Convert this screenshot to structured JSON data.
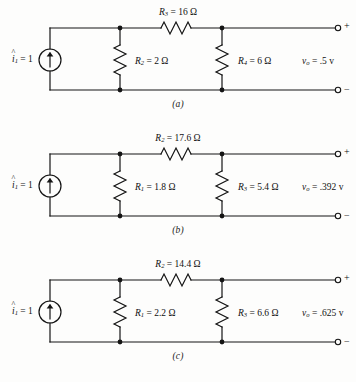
{
  "figure": {
    "type": "circuit-diagram-set",
    "panel_count": 3
  },
  "circuits": [
    {
      "id": "a",
      "caption": "(a)",
      "source": {
        "name": "current-source",
        "symbol": "i",
        "hat": "^",
        "subscript": "1",
        "equals": "=",
        "value": "1",
        "label_plain": "î1 = 1",
        "arrow_direction": "up"
      },
      "series_resistor": {
        "ref": "R",
        "subscript": "3",
        "value": "16",
        "unit": "Ω",
        "label_plain": "R3 = 16 Ω"
      },
      "shunt_left_resistor": {
        "ref": "R",
        "subscript": "2",
        "value": "2",
        "unit": "Ω",
        "label_plain": "R2 = 2 Ω"
      },
      "shunt_right_resistor": {
        "ref": "R",
        "subscript": "4",
        "value": "6",
        "unit": "Ω",
        "label_plain": "R4 = 6 Ω"
      },
      "output_voltage": {
        "ref": "v",
        "subscript": "o",
        "value": ".5",
        "unit": "v",
        "label_plain": "vo = .5 v"
      },
      "terminals": {
        "top": "+",
        "bottom": "−"
      }
    },
    {
      "id": "b",
      "caption": "(b)",
      "source": {
        "name": "current-source",
        "symbol": "i",
        "hat": "^",
        "subscript": "1",
        "equals": "=",
        "value": "1",
        "label_plain": "î1 = 1",
        "arrow_direction": "up"
      },
      "series_resistor": {
        "ref": "R",
        "subscript": "2",
        "value": "17.6",
        "unit": "Ω",
        "label_plain": "R2 = 17.6 Ω"
      },
      "shunt_left_resistor": {
        "ref": "R",
        "subscript": "1",
        "value": "1.8",
        "unit": "Ω",
        "label_plain": "R1 = 1.8 Ω"
      },
      "shunt_right_resistor": {
        "ref": "R",
        "subscript": "3",
        "value": "5.4",
        "unit": "Ω",
        "label_plain": "R3 = 5.4 Ω"
      },
      "output_voltage": {
        "ref": "v",
        "subscript": "o",
        "value": ".392",
        "unit": "v",
        "label_plain": "vo = .392 v"
      },
      "terminals": {
        "top": "+",
        "bottom": "−"
      }
    },
    {
      "id": "c",
      "caption": "(c)",
      "source": {
        "name": "current-source",
        "symbol": "i",
        "hat": "^",
        "subscript": "1",
        "equals": "=",
        "value": "1",
        "label_plain": "î1 = 1",
        "arrow_direction": "up"
      },
      "series_resistor": {
        "ref": "R",
        "subscript": "2",
        "value": "14.4",
        "unit": "Ω",
        "label_plain": "R2 = 14.4 Ω"
      },
      "shunt_left_resistor": {
        "ref": "R",
        "subscript": "1",
        "value": "2.2",
        "unit": "Ω",
        "label_plain": "R1 = 2.2 Ω"
      },
      "shunt_right_resistor": {
        "ref": "R",
        "subscript": "3",
        "value": "6.6",
        "unit": "Ω",
        "label_plain": "R3 = 6.6 Ω"
      },
      "output_voltage": {
        "ref": "v",
        "subscript": "o",
        "value": ".625",
        "unit": "v",
        "label_plain": "vo = .625 v"
      },
      "terminals": {
        "top": "+",
        "bottom": "−"
      }
    }
  ],
  "colors": {
    "ink": "#141414",
    "paper": "#fdfdfc"
  }
}
